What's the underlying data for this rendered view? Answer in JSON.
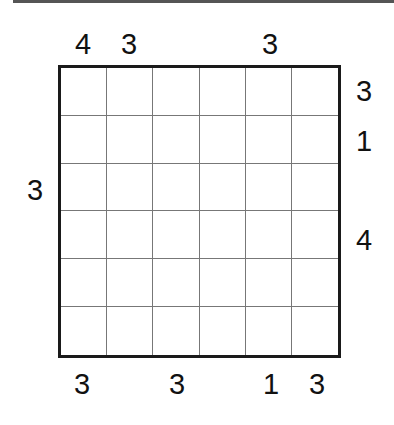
{
  "puzzle": {
    "rows": 6,
    "cols": 6,
    "clues": {
      "top": [
        "4",
        "3",
        "",
        "",
        "3",
        ""
      ],
      "bottom": [
        "3",
        "",
        "3",
        "",
        "1",
        "3"
      ],
      "left": [
        "",
        "",
        "3",
        "",
        "",
        ""
      ],
      "right": [
        "3",
        "1",
        "",
        "4",
        "",
        ""
      ]
    },
    "cells": [
      [
        "",
        "",
        "",
        "",
        "",
        ""
      ],
      [
        "",
        "",
        "",
        "",
        "",
        ""
      ],
      [
        "",
        "",
        "",
        "",
        "",
        ""
      ],
      [
        "",
        "",
        "",
        "",
        "",
        ""
      ],
      [
        "",
        "",
        "",
        "",
        "",
        ""
      ],
      [
        "",
        "",
        "",
        "",
        "",
        ""
      ]
    ]
  }
}
